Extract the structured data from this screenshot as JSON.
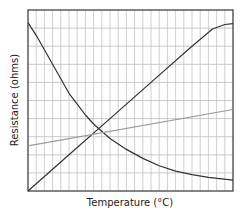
{
  "chart_data": {
    "type": "line",
    "title": "",
    "xlabel": "Temperature (°C)",
    "ylabel": "Resistance (ohms)",
    "xlim": [
      0,
      25
    ],
    "ylim": [
      0,
      10
    ],
    "grid": true,
    "grid_columns": 25,
    "grid_rows": 10,
    "tick_labels_shown": false,
    "legend": null,
    "series": [
      {
        "name": "Decreasing resistance (dark curve)",
        "color": "#333333",
        "points": [
          [
            0,
            9.3
          ],
          [
            1,
            8.6
          ],
          [
            2,
            7.8
          ],
          [
            3,
            7.0
          ],
          [
            4,
            6.2
          ],
          [
            5,
            5.4
          ],
          [
            6,
            4.8
          ],
          [
            7,
            4.2
          ],
          [
            8,
            3.7
          ],
          [
            9,
            3.3
          ],
          [
            10,
            2.9
          ],
          [
            12,
            2.3
          ],
          [
            14,
            1.8
          ],
          [
            16,
            1.4
          ],
          [
            18,
            1.1
          ],
          [
            20,
            0.9
          ],
          [
            22,
            0.75
          ],
          [
            25,
            0.6
          ]
        ]
      },
      {
        "name": "Increasing resistance (dark line)",
        "color": "#333333",
        "points": [
          [
            0,
            0.0
          ],
          [
            5,
            2.0
          ],
          [
            10,
            4.0
          ],
          [
            15,
            6.0
          ],
          [
            20,
            8.0
          ],
          [
            22.5,
            8.95
          ],
          [
            24,
            9.2
          ],
          [
            25,
            9.25
          ]
        ]
      },
      {
        "name": "Slowly increasing resistance (gray line)",
        "color": "#9a9a9a",
        "points": [
          [
            0,
            2.5
          ],
          [
            25,
            4.5
          ]
        ]
      }
    ]
  }
}
